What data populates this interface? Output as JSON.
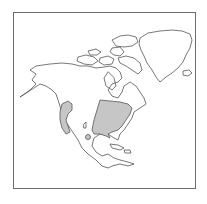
{
  "map": {
    "type": "species-range-map",
    "region": "North America",
    "colors": {
      "background": "#ffffff",
      "frame": "#6b6b6b",
      "outline": "#555555",
      "range_fill": "#c6c6c6"
    },
    "ranges": [
      {
        "name": "eastern-range",
        "area": "Eastern United States"
      },
      {
        "name": "western-range",
        "area": "Pacific Coast / Western North America"
      }
    ]
  }
}
